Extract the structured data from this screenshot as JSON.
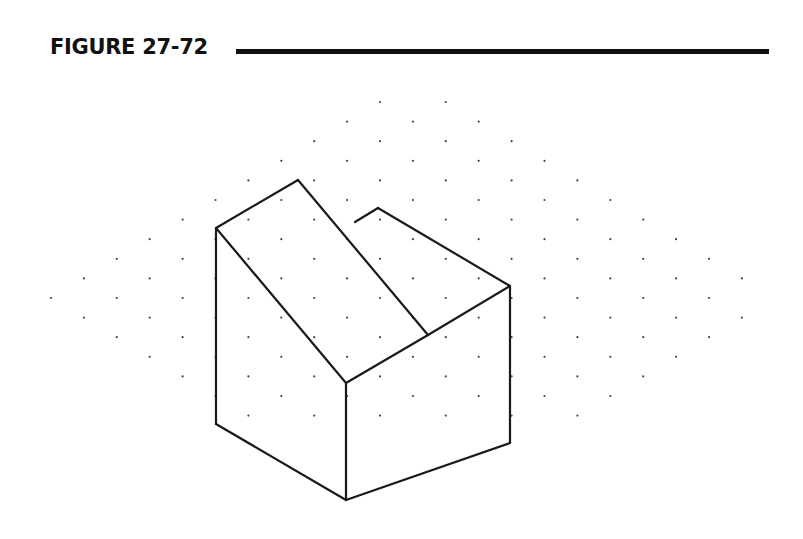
{
  "figure": {
    "label": "FIGURE 27-72",
    "rule_color": "#111111"
  },
  "drawing": {
    "type": "isometric-sketch",
    "description": "Isometric drawing of a block with a sloped face on isometric dot grid",
    "line_color": "#1a1a1a",
    "dot_color": "#444444",
    "grid": {
      "x_start": 51,
      "x_step": 32.9,
      "y_center": 298,
      "y_step": 19.6
    },
    "vertices": {
      "A": [
        216,
        228
      ],
      "B": [
        298,
        180
      ],
      "C": [
        428,
        335
      ],
      "D": [
        346,
        383
      ],
      "E": [
        378,
        208
      ],
      "F": [
        355,
        222
      ],
      "G": [
        510,
        286
      ],
      "H": [
        510,
        443
      ],
      "I": [
        346,
        500
      ],
      "J": [
        216,
        424
      ]
    },
    "edges": [
      [
        "A",
        "B"
      ],
      [
        "B",
        "C"
      ],
      [
        "A",
        "D"
      ],
      [
        "C",
        "D"
      ],
      [
        "C",
        "G"
      ],
      [
        "E",
        "G"
      ],
      [
        "E",
        "F"
      ],
      [
        "G",
        "H"
      ],
      [
        "H",
        "I"
      ],
      [
        "D",
        "I"
      ],
      [
        "I",
        "J"
      ],
      [
        "J",
        "A"
      ]
    ]
  }
}
